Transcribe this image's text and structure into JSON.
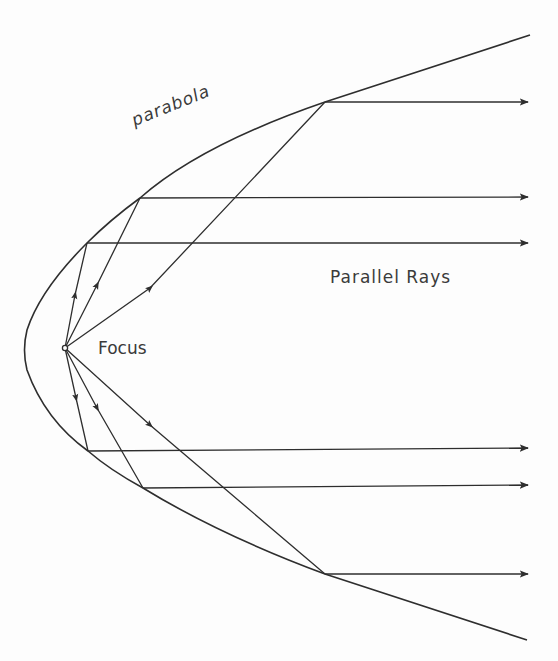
{
  "labels": {
    "parabola": "parabola",
    "focus": "Focus",
    "parallel_rays": "Parallel Rays"
  },
  "colors": {
    "line": "#2e2e2e",
    "text": "#3a3a3a",
    "background": "#fdfdfd"
  },
  "geometry": {
    "focus": [
      65,
      348
    ],
    "vertex": [
      25,
      350
    ],
    "parabola_top_end": [
      530,
      35
    ],
    "parabola_bottom_end": [
      527,
      640
    ],
    "reflection_points": [
      [
        325,
        102
      ],
      [
        140,
        198
      ],
      [
        87,
        243
      ],
      [
        88,
        451
      ],
      [
        143,
        488
      ],
      [
        325,
        574
      ]
    ],
    "arrow_tip_x": 528
  }
}
